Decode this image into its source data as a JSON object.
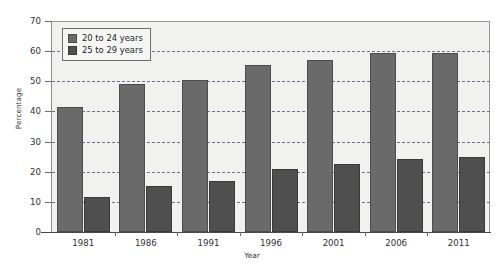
{
  "chart_data": {
    "type": "bar",
    "title": "",
    "subtitle": "",
    "xlabel": "Year",
    "ylabel": "Percentage",
    "categories": [
      "1981",
      "1986",
      "1991",
      "1996",
      "2001",
      "2006",
      "2011"
    ],
    "series": [
      {
        "name": "20 to 24 years",
        "color": "#6a6a6a",
        "values": [
          41.5,
          49,
          50.3,
          55.5,
          57,
          59.5,
          59.3
        ]
      },
      {
        "name": "25 to 29 years",
        "color": "#4f4f4f",
        "values": [
          11.5,
          15.3,
          17,
          21,
          22.5,
          24.2,
          25
        ]
      }
    ],
    "ylim": [
      0,
      70
    ],
    "yticks": [
      0,
      10,
      20,
      30,
      40,
      50,
      60,
      70
    ],
    "ytick_labels": [
      "0",
      "10",
      "20",
      "30",
      "40",
      "50",
      "60",
      "70"
    ],
    "grid": true,
    "grid_axis": "y",
    "legend_position": "upper-left",
    "plot_background": "#f1f1ef",
    "figure_background": "#ffffff"
  }
}
